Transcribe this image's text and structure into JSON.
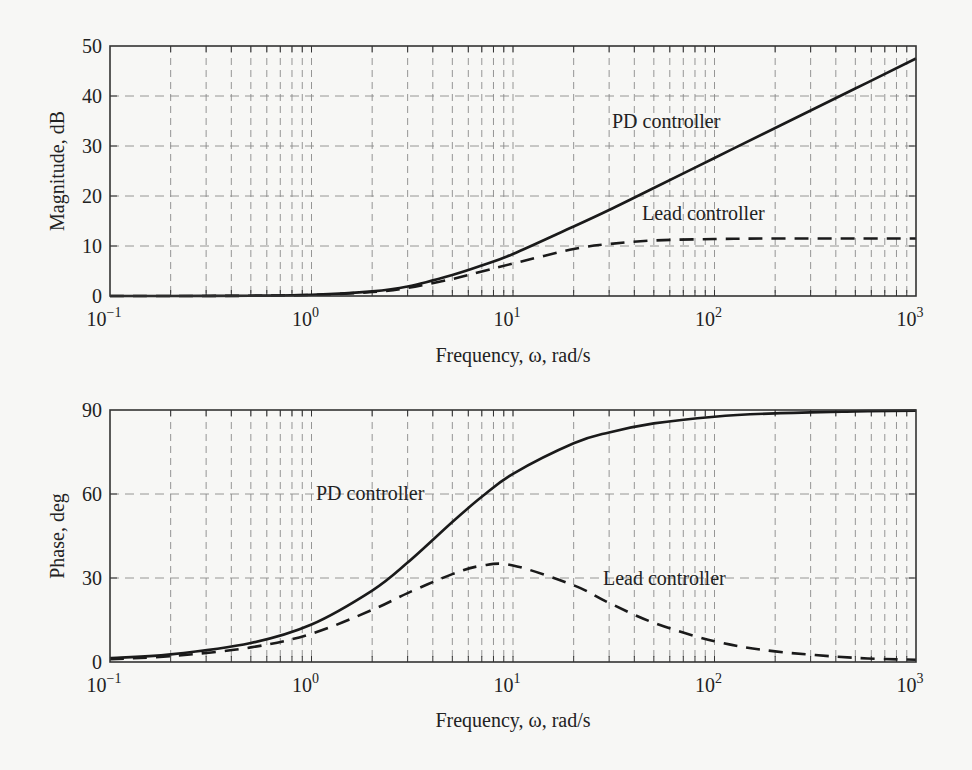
{
  "chart_data": [
    {
      "type": "line",
      "title": "",
      "xlabel": "Frequency, ω, rad/s",
      "ylabel": "Magnitude, dB",
      "xscale": "log",
      "xlim": [
        0.1,
        1000
      ],
      "ylim": [
        0,
        50
      ],
      "grid": true,
      "xticks": [
        "10^-1",
        "10^0",
        "10^1",
        "10^2",
        "10^3"
      ],
      "yticks": [
        0,
        10,
        20,
        30,
        40,
        50
      ],
      "x": [
        0.1,
        0.2,
        0.5,
        1,
        2,
        3,
        5,
        7,
        10,
        20,
        30,
        50,
        100,
        200,
        500,
        1000
      ],
      "series": [
        {
          "name": "PD controller",
          "style": "solid",
          "values": [
            0.0,
            0.0,
            0.06,
            0.24,
            0.92,
            1.9,
            4.2,
            6.1,
            8.4,
            13.9,
            17.2,
            21.6,
            27.6,
            33.6,
            41.5,
            47.5
          ]
        },
        {
          "name": "Lead controller",
          "style": "dashed",
          "values": [
            0.0,
            0.0,
            0.05,
            0.21,
            0.8,
            1.6,
            3.4,
            4.9,
            6.5,
            9.4,
            10.4,
            11.1,
            11.4,
            11.5,
            11.5,
            11.5
          ]
        }
      ],
      "annotations": [
        {
          "text": "PD controller",
          "x": 40,
          "y": 34
        },
        {
          "text": "Lead controller",
          "x": 60,
          "y": 15.5
        }
      ]
    },
    {
      "type": "line",
      "title": "",
      "xlabel": "Frequency, ω, rad/s",
      "ylabel": "Phase, deg",
      "xscale": "log",
      "xlim": [
        0.1,
        1000
      ],
      "ylim": [
        0,
        90
      ],
      "grid": true,
      "xticks": [
        "10^-1",
        "10^0",
        "10^1",
        "10^2",
        "10^3"
      ],
      "yticks": [
        0,
        30,
        60,
        90
      ],
      "x": [
        0.1,
        0.2,
        0.5,
        1,
        2,
        3,
        5,
        7,
        10,
        20,
        30,
        50,
        100,
        200,
        500,
        1000
      ],
      "series": [
        {
          "name": "PD controller",
          "style": "solid",
          "values": [
            1.4,
            2.7,
            6.8,
            13.4,
            25.5,
            35.5,
            50.0,
            59.0,
            67.2,
            78.1,
            82.0,
            85.2,
            87.6,
            88.8,
            89.5,
            89.8
          ]
        },
        {
          "name": "Lead controller",
          "style": "dashed",
          "values": [
            1.0,
            2.1,
            5.2,
            10.1,
            18.6,
            24.6,
            31.4,
            34.4,
            34.5,
            27.4,
            21.1,
            14.0,
            7.4,
            3.8,
            1.5,
            0.8
          ]
        }
      ],
      "annotations": [
        {
          "text": "PD controller",
          "x": 0.9,
          "y": 60
        },
        {
          "text": "Lead controller",
          "x": 40,
          "y": 27
        }
      ]
    }
  ],
  "plots": {
    "top": {
      "ylabel": "Magnitude, dB",
      "xlabel": "Frequency, ω, rad/s",
      "yticks": [
        "0",
        "10",
        "20",
        "30",
        "40",
        "50"
      ],
      "label_pd": "PD controller",
      "label_lead": "Lead controller"
    },
    "bottom": {
      "ylabel": "Phase, deg",
      "xlabel": "Frequency, ω, rad/s",
      "yticks": [
        "0",
        "30",
        "60",
        "90"
      ],
      "label_pd": "PD controller",
      "label_lead": "Lead controller"
    },
    "xticks": [
      {
        "base": "10",
        "exp": "−1"
      },
      {
        "base": "10",
        "exp": "0"
      },
      {
        "base": "10",
        "exp": "1"
      },
      {
        "base": "10",
        "exp": "2"
      },
      {
        "base": "10",
        "exp": "3"
      }
    ]
  },
  "colors": {
    "curve": "#1a1a1a",
    "grid": "#8a8a8a",
    "frame": "#333333",
    "background": "#f7f7f5"
  }
}
